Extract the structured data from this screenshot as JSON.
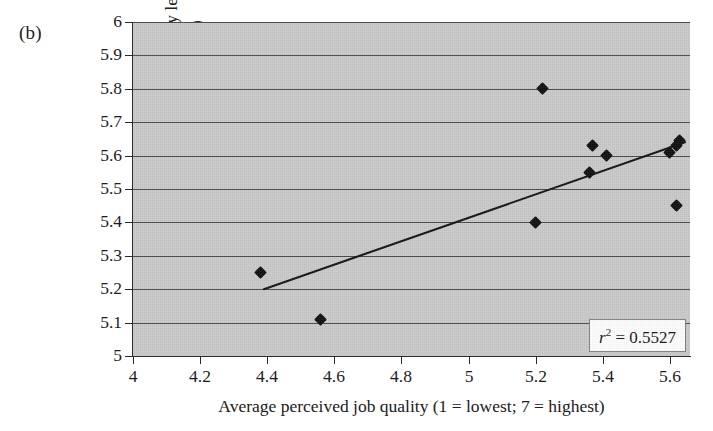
{
  "panel": {
    "label": "(b)"
  },
  "axes": {
    "x_title": "Average perceived job quality (1 = lowest; 7 = highest)",
    "y_title_line1": "Average perceived productivity level",
    "y_title_line2": "(1 = lowest; 7 = highest)",
    "x_ticks": [
      "4",
      "4.2",
      "4.4",
      "4.6",
      "4.8",
      "5",
      "5.2",
      "5.4",
      "5.6"
    ],
    "y_ticks": [
      "6",
      "5.9",
      "5.8",
      "5.7",
      "5.6",
      "5.5",
      "5.4",
      "5.3",
      "5.2",
      "5.1",
      "5"
    ]
  },
  "annotation": {
    "r2_symbol": "r",
    "r2_exponent": "2",
    "r2_text": "= 0.5527",
    "r2_full": "r2 = 0.5527"
  },
  "colors": {
    "plot_background": "#c9c9c9",
    "gridline": "#4a4a4a",
    "marker": "#101010",
    "trendline": "#141414",
    "axis": "#2a2a2a",
    "page_background": "#ffffff"
  },
  "chart_data": {
    "type": "scatter",
    "title": "",
    "xlabel": "Average perceived job quality (1 = lowest; 7 = highest)",
    "ylabel": "Average perceived productivity level (1 = lowest; 7 = highest)",
    "xlim": [
      4,
      5.66
    ],
    "ylim": [
      5,
      6
    ],
    "xticks": [
      4,
      4.2,
      4.4,
      4.6,
      4.8,
      5,
      5.2,
      5.4,
      5.6
    ],
    "yticks": [
      5,
      5.1,
      5.2,
      5.3,
      5.4,
      5.5,
      5.6,
      5.7,
      5.8,
      5.9,
      6
    ],
    "grid": "horizontal",
    "legend": "none",
    "points": [
      {
        "x": 4.38,
        "y": 5.25
      },
      {
        "x": 4.56,
        "y": 5.11
      },
      {
        "x": 5.2,
        "y": 5.4
      },
      {
        "x": 5.22,
        "y": 5.8
      },
      {
        "x": 5.36,
        "y": 5.55
      },
      {
        "x": 5.37,
        "y": 5.63
      },
      {
        "x": 5.41,
        "y": 5.6
      },
      {
        "x": 5.6,
        "y": 5.61
      },
      {
        "x": 5.62,
        "y": 5.63
      },
      {
        "x": 5.63,
        "y": 5.645
      },
      {
        "x": 5.62,
        "y": 5.45
      }
    ],
    "trendline": {
      "type": "linear",
      "x_start": 4.39,
      "y_start": 5.2,
      "x_end": 5.645,
      "y_end": 5.64
    },
    "annotations": [
      {
        "text": "r2 = 0.5527",
        "position": "bottom-right"
      }
    ]
  }
}
